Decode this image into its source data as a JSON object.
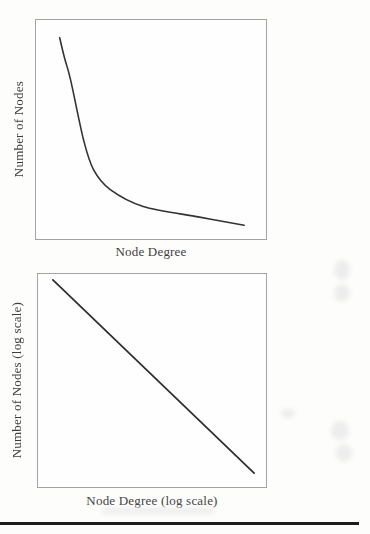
{
  "page": {
    "background": "#fdfdfc",
    "rule_color": "#1d1d1d",
    "text_color": "#3f3f3f"
  },
  "chart_data": [
    {
      "type": "line",
      "title": "",
      "xlabel": "Node Degree",
      "ylabel": "Number of Nodes",
      "x_scale": "linear",
      "y_scale": "linear",
      "axis_ticks": "none",
      "grid": "off",
      "legend": "none",
      "curve_shape": "power-law decay: steep drop at low degree, long flat tail at high degree",
      "stroke": "#333333",
      "stroke_width": 1.6,
      "x_range_normalized": [
        0,
        1
      ],
      "y_range_normalized": [
        0,
        1
      ],
      "points": [
        [
          0.103,
          0.919
        ],
        [
          0.125,
          0.823
        ],
        [
          0.151,
          0.724
        ],
        [
          0.207,
          0.452
        ],
        [
          0.25,
          0.317
        ],
        [
          0.323,
          0.226
        ],
        [
          0.466,
          0.149
        ],
        [
          0.711,
          0.1
        ],
        [
          0.905,
          0.063
        ]
      ]
    },
    {
      "type": "line",
      "title": "",
      "xlabel": "Node Degree (log scale)",
      "ylabel": "Number of Nodes (log scale)",
      "x_scale": "log",
      "y_scale": "log",
      "axis_ticks": "none",
      "grid": "off",
      "legend": "none",
      "curve_shape": "straight descending line on log-log axes (power law)",
      "stroke": "#2f2f2f",
      "stroke_width": 1.8,
      "x_range_normalized": [
        0,
        1
      ],
      "y_range_normalized": [
        0,
        1
      ],
      "points": [
        [
          0.065,
          0.972
        ],
        [
          0.948,
          0.065
        ]
      ]
    }
  ]
}
